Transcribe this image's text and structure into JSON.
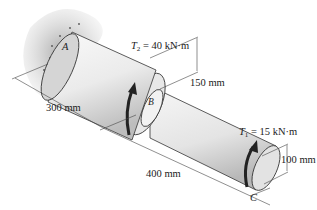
{
  "diagram": {
    "type": "torsion-shaft",
    "points": {
      "a": "A",
      "b": "B",
      "c": "C"
    },
    "torques": {
      "t2": {
        "symbol": "T",
        "subscript": "2",
        "value": "= 40 kN·m"
      },
      "t1": {
        "symbol": "T",
        "subscript": "1",
        "value": "= 15 kN·m"
      }
    },
    "dimensions": {
      "ab_length": "300 mm",
      "bc_length": "400 mm",
      "large_diameter": "150 mm",
      "small_diameter": "100 mm"
    },
    "colors": {
      "shaft_light": "#f4f4f4",
      "shaft_shade": "#c9c9c9",
      "wall": "#b5b5b5",
      "torque_arrow": "#222222",
      "lines": "#333333"
    }
  }
}
